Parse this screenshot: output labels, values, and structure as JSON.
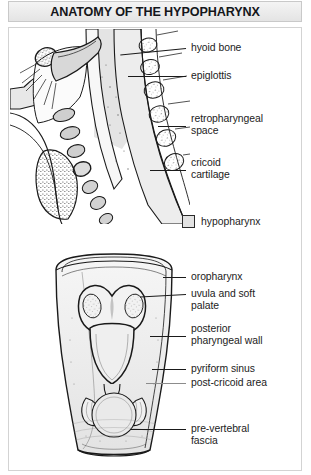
{
  "header": {
    "title": "ANATOMY OF THE HYPOPHARYNX"
  },
  "legend": {
    "swatch_icon": "filled-square-icon",
    "swatch_color": "#e2e2e2",
    "label": "hypopharynx"
  },
  "panels": [
    {
      "id": "sagittal-section",
      "name": "sagittal section of head and neck",
      "labels": [
        {
          "id": "hyoid-bone",
          "text": "hyoid bone"
        },
        {
          "id": "epiglottis",
          "text": "epiglottis"
        },
        {
          "id": "retropharyngeal-space",
          "text": "retropharyngeal\nspace"
        },
        {
          "id": "cricoid-cartilage",
          "text": "cricoid\ncartilage"
        }
      ]
    },
    {
      "id": "coronal-posterior-view",
      "name": "opened posterior view of the pharynx",
      "labels": [
        {
          "id": "oropharynx",
          "text": "oropharynx"
        },
        {
          "id": "uvula-and-soft-palate",
          "text": "uvula and soft\npalate"
        },
        {
          "id": "posterior-pharyngeal-wall",
          "text": "posterior\npharyngeal wall"
        },
        {
          "id": "pyriform-sinus",
          "text": "pyriform sinus"
        },
        {
          "id": "post-cricoid-area",
          "text": "post-cricoid area"
        },
        {
          "id": "pre-vertebral-fascia",
          "text": "pre-vertebral\nfascia"
        }
      ]
    }
  ],
  "colors": {
    "ink": "#1a1a1a",
    "title_text": "#14161a",
    "banner_bg": "#ededed",
    "frame_border": "#d3d3d3",
    "tissue_light": "#ebebeb",
    "tissue_mid": "#d6d6d6",
    "tissue_dark": "#b9b9b9"
  }
}
